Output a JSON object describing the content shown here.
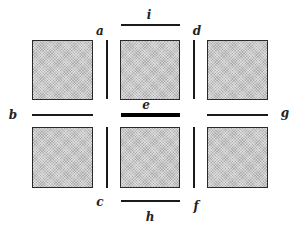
{
  "diagram": {
    "type": "grid-of-squares-with-edges",
    "colors": {
      "square_fill": "#c9c9c9",
      "square_border": "#2a2a2a",
      "line": "#1a1a1a",
      "highlight_line": "#000000"
    },
    "squares": [
      {
        "id": "top-left",
        "row": 0,
        "col": 0
      },
      {
        "id": "top-middle",
        "row": 0,
        "col": 1
      },
      {
        "id": "top-right",
        "row": 0,
        "col": 2
      },
      {
        "id": "bottom-left",
        "row": 1,
        "col": 0
      },
      {
        "id": "bottom-middle",
        "row": 1,
        "col": 1
      },
      {
        "id": "bottom-right",
        "row": 1,
        "col": 2
      }
    ],
    "labels": {
      "a": "a",
      "b": "b",
      "c": "c",
      "d": "d",
      "e": "e",
      "f": "f",
      "g": "g",
      "h": "h",
      "i": "i"
    },
    "segments": [
      {
        "label": "a",
        "orientation": "vertical",
        "position": "between top-left and top-middle"
      },
      {
        "label": "b",
        "orientation": "horizontal",
        "position": "between top-left and bottom-left"
      },
      {
        "label": "c",
        "orientation": "vertical",
        "position": "between bottom-left and bottom-middle"
      },
      {
        "label": "d",
        "orientation": "vertical",
        "position": "between top-middle and top-right"
      },
      {
        "label": "e",
        "orientation": "horizontal",
        "position": "between top-middle and bottom-middle",
        "emphasis": "thick"
      },
      {
        "label": "f",
        "orientation": "vertical",
        "position": "between bottom-middle and bottom-right"
      },
      {
        "label": "g",
        "orientation": "horizontal",
        "position": "between top-right and bottom-right"
      },
      {
        "label": "h",
        "orientation": "horizontal",
        "position": "below bottom-middle"
      },
      {
        "label": "i",
        "orientation": "horizontal",
        "position": "above top-middle"
      }
    ]
  }
}
